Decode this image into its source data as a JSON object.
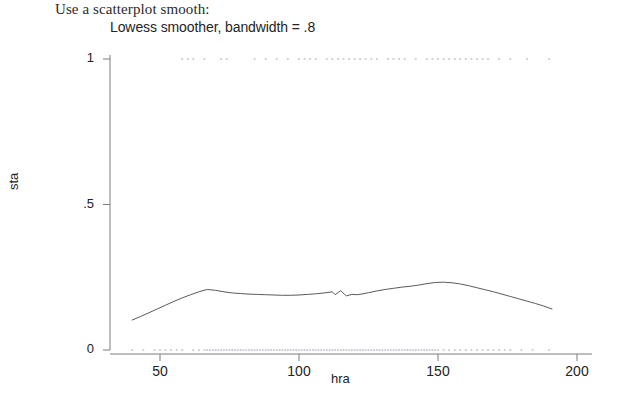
{
  "header": {
    "prompt_text": "Use a scatterplot smooth:",
    "subtitle": "Lowess smoother, bandwidth = .8"
  },
  "chart_data": {
    "type": "scatter",
    "title": "Lowess smoother, bandwidth = .8",
    "xlabel": "hra",
    "ylabel": "sta",
    "xlim": [
      38,
      200
    ],
    "ylim": [
      0,
      1
    ],
    "xticks": [
      50,
      100,
      150,
      200
    ],
    "xtick_labels": [
      "50",
      "100",
      "150",
      "200"
    ],
    "yticks": [
      0,
      0.5,
      1
    ],
    "ytick_labels": [
      "0",
      ".5",
      "1"
    ],
    "grid": false,
    "legend": "none",
    "axis_color": "#7d7d7d",
    "point_color": "#c9c9d2",
    "line_color": "#5a5a5a",
    "series": [
      {
        "name": "sta observations (y = 1)",
        "type": "scatter",
        "y_value": 1,
        "x": [
          58,
          60,
          62,
          66,
          72,
          74,
          84,
          88,
          92,
          96,
          100,
          102,
          104,
          106,
          110,
          112,
          114,
          116,
          118,
          120,
          122,
          124,
          126,
          128,
          132,
          134,
          136,
          138,
          142,
          146,
          148,
          150,
          152,
          154,
          156,
          158,
          160,
          162,
          164,
          166,
          168,
          172,
          176,
          182,
          190
        ]
      },
      {
        "name": "sta observations (y = 0)",
        "type": "scatter",
        "y_value": 0,
        "x": [
          40,
          44,
          48,
          50,
          52,
          54,
          56,
          58,
          62,
          64,
          66,
          67,
          68,
          69,
          70,
          71,
          72,
          73,
          74,
          75,
          76,
          77,
          78,
          79,
          80,
          81,
          82,
          83,
          84,
          85,
          86,
          87,
          88,
          89,
          90,
          91,
          92,
          93,
          94,
          95,
          96,
          97,
          98,
          99,
          100,
          101,
          102,
          103,
          104,
          105,
          106,
          107,
          108,
          109,
          110,
          111,
          112,
          113,
          114,
          115,
          116,
          117,
          118,
          119,
          120,
          121,
          122,
          123,
          124,
          125,
          126,
          127,
          128,
          129,
          130,
          131,
          132,
          133,
          134,
          135,
          136,
          137,
          138,
          139,
          140,
          141,
          142,
          143,
          144,
          145,
          146,
          147,
          148,
          149,
          150,
          152,
          154,
          156,
          158,
          160,
          162,
          164,
          166,
          168,
          170,
          172,
          174,
          176,
          180,
          184,
          190
        ]
      },
      {
        "name": "lowess fit",
        "type": "line",
        "x": [
          40,
          43,
          46,
          49,
          52,
          55,
          58,
          61,
          64,
          67,
          70,
          73,
          76,
          79,
          82,
          85,
          88,
          91,
          94,
          97,
          100,
          103,
          106,
          109,
          112,
          113,
          115,
          117,
          119,
          121,
          123,
          125,
          128,
          131,
          134,
          137,
          140,
          143,
          146,
          149,
          152,
          155,
          158,
          161,
          164,
          167,
          170,
          173,
          176,
          179,
          182,
          185,
          188,
          191
        ],
        "y": [
          0.103,
          0.115,
          0.128,
          0.141,
          0.154,
          0.167,
          0.179,
          0.19,
          0.2,
          0.208,
          0.205,
          0.2,
          0.196,
          0.194,
          0.192,
          0.191,
          0.19,
          0.189,
          0.188,
          0.188,
          0.189,
          0.191,
          0.193,
          0.196,
          0.2,
          0.19,
          0.204,
          0.186,
          0.191,
          0.19,
          0.193,
          0.197,
          0.203,
          0.208,
          0.212,
          0.216,
          0.219,
          0.223,
          0.228,
          0.232,
          0.233,
          0.231,
          0.227,
          0.221,
          0.214,
          0.207,
          0.2,
          0.192,
          0.184,
          0.176,
          0.168,
          0.16,
          0.151,
          0.141
        ]
      }
    ]
  }
}
